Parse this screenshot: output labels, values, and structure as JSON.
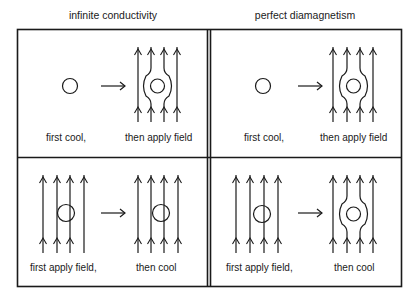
{
  "diagram": {
    "columns": [
      {
        "title": "infinite conductivity"
      },
      {
        "title": "perfect diamagnetism"
      }
    ],
    "panels": [
      {
        "id": "top-left",
        "column": "infinite conductivity",
        "before_label": "first cool,",
        "after_label": "then apply field",
        "before_state": "circle, no field",
        "after_state": "field lines excluded around superconductor"
      },
      {
        "id": "top-right",
        "column": "perfect diamagnetism",
        "before_label": "first cool,",
        "after_label": "then apply field",
        "before_state": "circle, no field",
        "after_state": "field lines excluded around superconductor"
      },
      {
        "id": "bottom-left",
        "column": "infinite conductivity",
        "before_label": "first apply field,",
        "after_label": "then cool",
        "before_state": "field lines pass through circle",
        "after_state": "field lines still pass through circle (flux trapped)"
      },
      {
        "id": "bottom-right",
        "column": "perfect diamagnetism",
        "before_label": "first apply field,",
        "after_label": "then cool",
        "before_state": "field lines pass through circle",
        "after_state": "field lines expelled around superconductor (Meissner effect)"
      }
    ],
    "colors": {
      "stroke": "#1a1a1a",
      "background": "#ffffff"
    }
  }
}
